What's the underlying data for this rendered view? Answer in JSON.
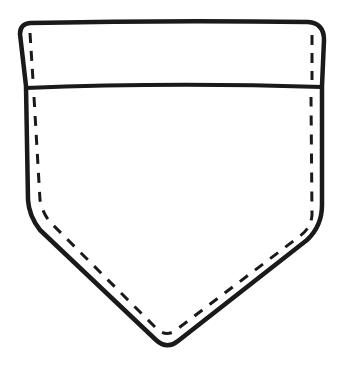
{
  "illustration": {
    "subject": "shirt-pocket-outline",
    "stroke_color": "#1a1a1a",
    "background_color": "#ffffff",
    "parts": [
      "pocket-outline",
      "flap-seam",
      "stitching-flap",
      "stitching-body"
    ]
  }
}
